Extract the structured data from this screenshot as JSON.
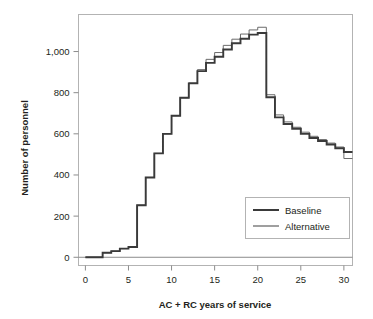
{
  "chart_data": {
    "type": "line",
    "subtype": "step",
    "title": "",
    "xlabel": "AC + RC years of service",
    "ylabel": "Number of personnel",
    "xlim": [
      -0.8,
      31.0
    ],
    "ylim": [
      -40,
      1180
    ],
    "xticks": [
      0,
      5,
      10,
      15,
      20,
      25,
      30
    ],
    "xtick_labels": [
      "0",
      "5",
      "10",
      "15",
      "20",
      "25",
      "30"
    ],
    "yticks": [
      0,
      200,
      400,
      600,
      800,
      1000
    ],
    "ytick_labels": [
      "0",
      "200",
      "400",
      "600",
      "800",
      "1,000"
    ],
    "grid": false,
    "legend_position": "lower right",
    "x": [
      0,
      1,
      2,
      3,
      4,
      5,
      6,
      7,
      8,
      9,
      10,
      11,
      12,
      13,
      14,
      15,
      16,
      17,
      18,
      19,
      20,
      21,
      22,
      23,
      24,
      25,
      26,
      27,
      28,
      29,
      30
    ],
    "series": [
      {
        "name": "Baseline",
        "color": "#3a3a3a",
        "values": [
          0,
          0,
          22,
          30,
          42,
          50,
          253,
          388,
          505,
          600,
          688,
          775,
          845,
          905,
          945,
          975,
          1010,
          1040,
          1062,
          1082,
          1090,
          778,
          680,
          648,
          625,
          600,
          580,
          565,
          548,
          530,
          512
        ]
      },
      {
        "name": "Alternative",
        "color": "#6b6b6b",
        "values": [
          0,
          0,
          22,
          30,
          42,
          50,
          253,
          388,
          505,
          600,
          688,
          775,
          848,
          912,
          962,
          995,
          1030,
          1060,
          1085,
          1105,
          1118,
          790,
          692,
          658,
          632,
          608,
          588,
          572,
          555,
          536,
          480
        ]
      }
    ]
  },
  "legend": {
    "entries": [
      {
        "label": "Baseline"
      },
      {
        "label": "Alternative"
      }
    ]
  }
}
